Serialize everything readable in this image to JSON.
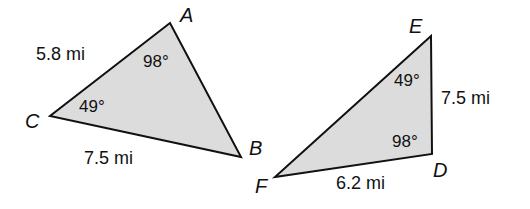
{
  "diagram": {
    "colors": {
      "fill": "#dcdcdc",
      "stroke": "#111111",
      "background": "#ffffff"
    },
    "triangle_abc": {
      "vertices": {
        "A": "A",
        "B": "B",
        "C": "C"
      },
      "sides": {
        "CA": "5.8 mi",
        "CB": "7.5 mi"
      },
      "angles": {
        "A": "98°",
        "C": "49°"
      }
    },
    "triangle_def": {
      "vertices": {
        "D": "D",
        "E": "E",
        "F": "F"
      },
      "sides": {
        "ED": "7.5 mi",
        "FD": "6.2 mi"
      },
      "angles": {
        "E": "49°",
        "D": "98°"
      }
    }
  }
}
